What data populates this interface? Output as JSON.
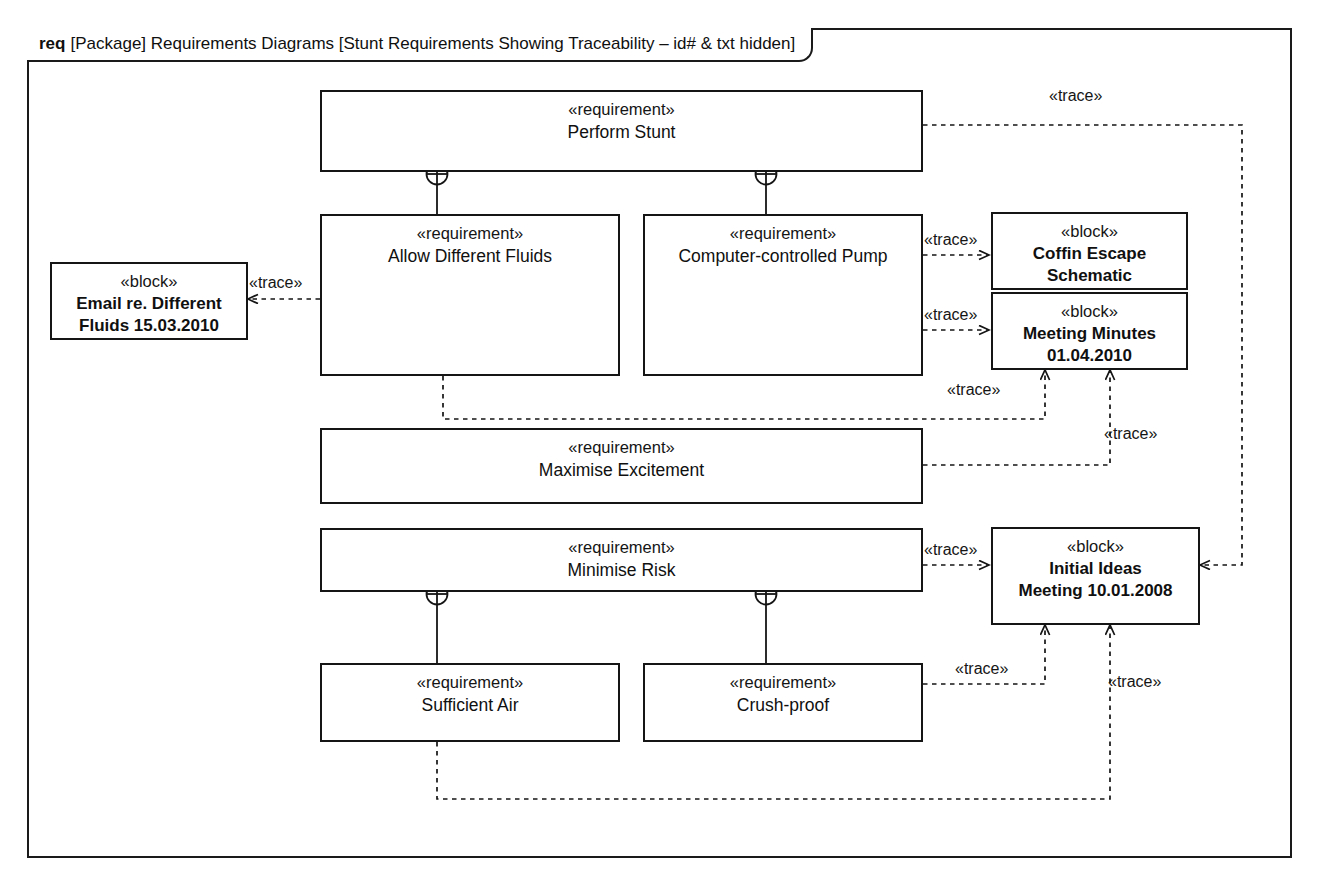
{
  "diagram": {
    "frame_keyword": "req",
    "frame_title": "[Package] Requirements Diagrams [Stunt Requirements Showing Traceability – id# & txt hidden]",
    "kind": "sysml-requirement-diagram",
    "stereotype_requirement": "«requirement»",
    "stereotype_block": "«block»",
    "relation_label": "«trace»"
  },
  "nodes": {
    "perform_stunt": {
      "stereotype": "«requirement»",
      "name": "Perform Stunt"
    },
    "allow_fluids": {
      "stereotype": "«requirement»",
      "name": "Allow Different Fluids"
    },
    "pump": {
      "stereotype": "«requirement»",
      "name": "Computer-controlled Pump"
    },
    "maximise": {
      "stereotype": "«requirement»",
      "name": "Maximise Excitement"
    },
    "minimise_risk": {
      "stereotype": "«requirement»",
      "name": "Minimise Risk"
    },
    "sufficient_air": {
      "stereotype": "«requirement»",
      "name": "Sufficient Air"
    },
    "crush_proof": {
      "stereotype": "«requirement»",
      "name": "Crush-proof"
    },
    "email_block": {
      "stereotype": "«block»",
      "name": "Email re. Different\nFluids 15.03.2010"
    },
    "coffin_block": {
      "stereotype": "«block»",
      "name": "Coffin Escape\nSchematic"
    },
    "minutes_block": {
      "stereotype": "«block»",
      "name": "Meeting Minutes\n01.04.2010"
    },
    "ideas_block": {
      "stereotype": "«block»",
      "name": "Initial Ideas\nMeeting 10.01.2008"
    }
  },
  "edge_labels": {
    "perform_to_ideas": "«trace»",
    "pump_to_coffin": "«trace»",
    "pump_to_minutes": "«trace»",
    "fluids_to_email": "«trace»",
    "fluids_to_minutes": "«trace»",
    "maximise_to_minutes": "«trace»",
    "risk_to_ideas": "«trace»",
    "crush_to_ideas": "«trace»",
    "air_to_ideas": "«trace»"
  },
  "containment": {
    "perform_stunt_children": [
      "Allow Different Fluids",
      "Computer-controlled Pump"
    ],
    "minimise_risk_children": [
      "Sufficient Air",
      "Crush-proof"
    ]
  },
  "colors": {
    "line": "#151515",
    "text": "#101010",
    "background": "#ffffff"
  }
}
